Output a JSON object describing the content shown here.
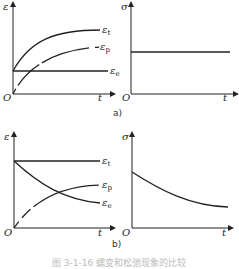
{
  "figure": {
    "panel_a_label": "a)",
    "panel_b_label": "b)",
    "caption": "图 3-1-16  蠕变和松弛现象的比较"
  },
  "panels": {
    "a_left": {
      "ylabel": "ε",
      "xlabel": "t",
      "origin": "O",
      "curves": [
        {
          "name": "ε_t",
          "label": "ε",
          "sub": "t"
        },
        {
          "name": "ε_p",
          "label": "ε",
          "sub": "p"
        },
        {
          "name": "ε_e",
          "label": "ε",
          "sub": "e"
        }
      ]
    },
    "a_right": {
      "ylabel": "σ",
      "xlabel": "t",
      "origin": "O"
    },
    "b_left": {
      "ylabel": "ε",
      "xlabel": "t",
      "origin": "O",
      "curves": [
        {
          "name": "ε_t",
          "label": "ε",
          "sub": "t"
        },
        {
          "name": "ε_p",
          "label": "ε",
          "sub": "p"
        },
        {
          "name": "ε_e",
          "label": "ε",
          "sub": "e"
        }
      ]
    },
    "b_right": {
      "ylabel": "σ",
      "xlabel": "t",
      "origin": "O"
    }
  }
}
